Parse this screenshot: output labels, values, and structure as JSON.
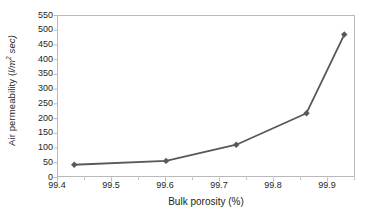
{
  "chart_data": {
    "type": "line",
    "title": "",
    "xlabel": "Bulk porosity (%)",
    "ylabel": "Air permeability (l/m2 sec)",
    "ylabel_text": "Air permeability (",
    "ylabel_unit_pre": "l/m",
    "ylabel_unit_sup": "2",
    "ylabel_unit_post": " sec)",
    "x": [
      99.43,
      99.6,
      99.73,
      99.86,
      99.93
    ],
    "values": [
      45,
      58,
      113,
      220,
      487
    ],
    "series": [
      {
        "name": "Air permeability",
        "x": [
          99.43,
          99.6,
          99.73,
          99.86,
          99.93
        ],
        "values": [
          45,
          58,
          113,
          220,
          487
        ],
        "color": "#55595c",
        "marker": "diamond"
      }
    ],
    "xlim": [
      99.4,
      99.9517
    ],
    "ylim": [
      0,
      550
    ],
    "xticks": [
      99.4,
      99.5,
      99.6,
      99.7,
      99.8,
      99.9
    ],
    "xtick_labels": [
      "99.4",
      "99.5",
      "99.6",
      "99.7",
      "99.8",
      "99.9"
    ],
    "yticks": [
      0,
      50,
      100,
      150,
      200,
      250,
      300,
      350,
      400,
      450,
      500,
      550
    ],
    "ytick_labels": [
      "0",
      "50",
      "100",
      "150",
      "200",
      "250",
      "300",
      "350",
      "400",
      "450",
      "500",
      "550"
    ],
    "grid": false,
    "legend": false,
    "legend_position": "none",
    "line_color": "#55595c",
    "marker_color": "#55595c",
    "axis_color": "#b9b9bb",
    "tick_color": "#b9b9bb",
    "text_color": "#231f20",
    "background_color": "#ffffff"
  }
}
